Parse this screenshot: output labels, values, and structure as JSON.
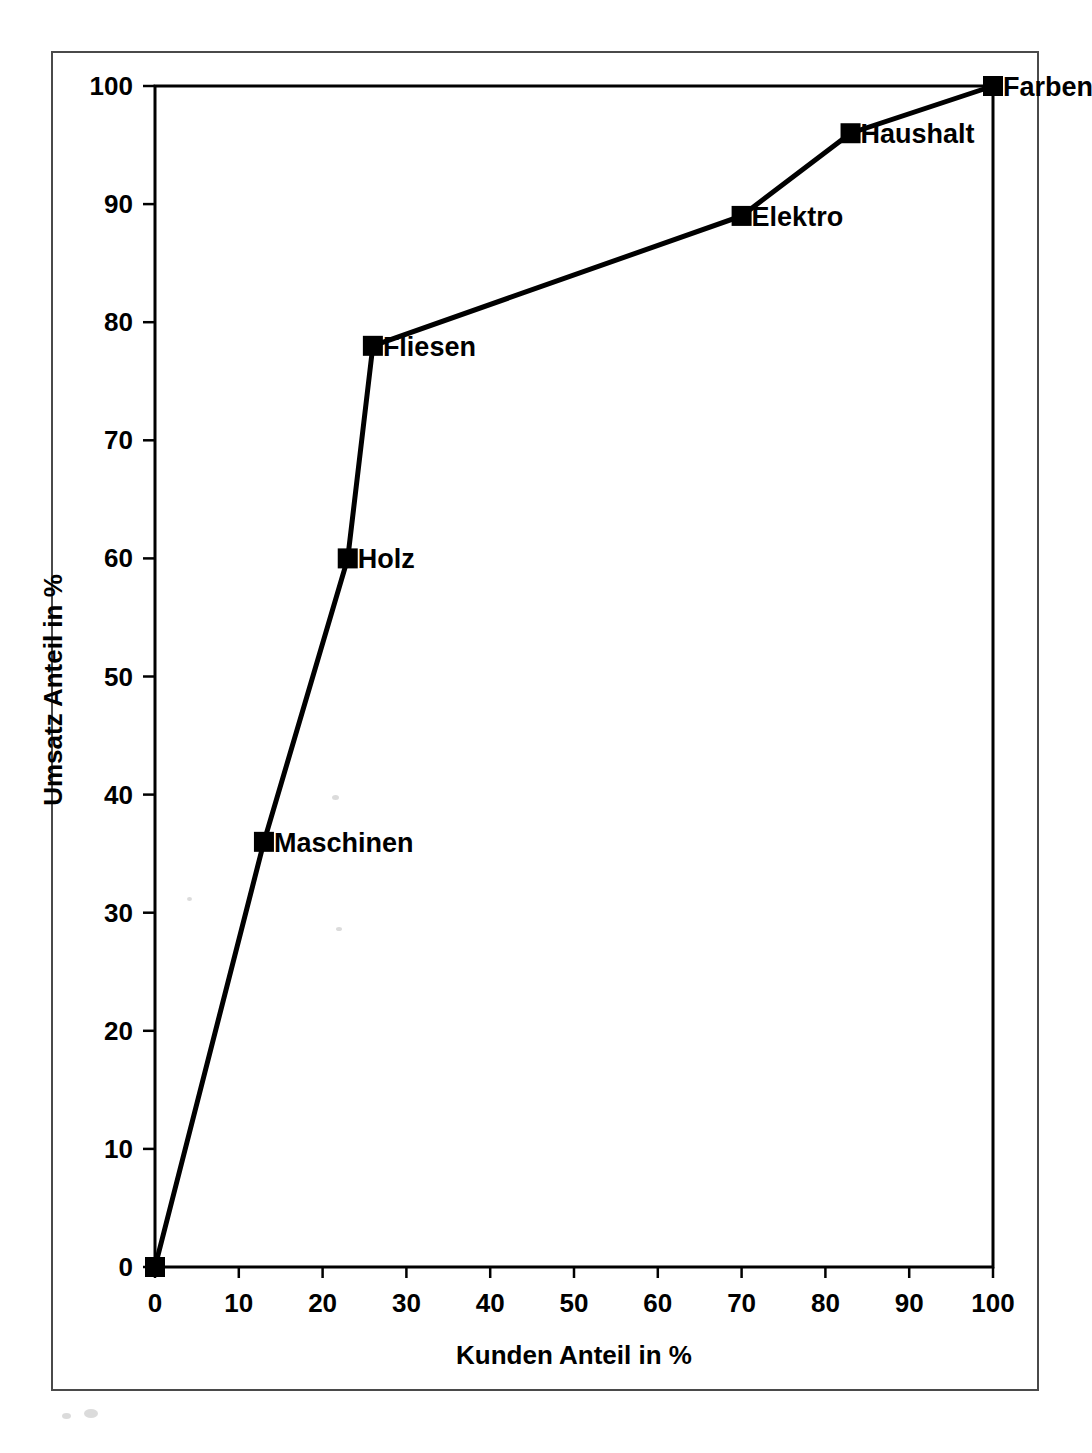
{
  "chart_data": {
    "type": "line",
    "title": "",
    "subtitle": "",
    "xlabel": "Kunden Anteil in %",
    "ylabel": "Umsatz Anteil in %",
    "xlim": [
      0,
      100
    ],
    "ylim": [
      0,
      100
    ],
    "xticks": [
      0,
      10,
      20,
      30,
      40,
      50,
      60,
      70,
      80,
      90,
      100
    ],
    "yticks": [
      0,
      10,
      20,
      30,
      40,
      50,
      60,
      70,
      80,
      90,
      100
    ],
    "xtick_labels": [
      "0",
      "10",
      "20",
      "30",
      "40",
      "50",
      "60",
      "70",
      "80",
      "90",
      "100"
    ],
    "ytick_labels": [
      "0",
      "10",
      "20",
      "30",
      "40",
      "50",
      "60",
      "70",
      "80",
      "90",
      "100"
    ],
    "grid": false,
    "legend": false,
    "marker": "filled-square",
    "line_color": "#000000",
    "marker_color": "#000000",
    "series": [
      {
        "name": "Kumulierte Umsatzkurve",
        "x": [
          0,
          13,
          23,
          26,
          70,
          83,
          100
        ],
        "y": [
          0,
          36,
          60,
          78,
          89,
          96,
          100
        ],
        "point_labels": [
          "",
          "Maschinen",
          "Holz",
          "Fliesen",
          "Elektro",
          "Haushalt",
          "Farben"
        ]
      }
    ],
    "annotations": [
      {
        "text": "Maschinen",
        "x": 13,
        "y": 36
      },
      {
        "text": "Holz",
        "x": 23,
        "y": 60
      },
      {
        "text": "Fliesen",
        "x": 26,
        "y": 78
      },
      {
        "text": "Elektro",
        "x": 70,
        "y": 89
      },
      {
        "text": "Haushalt",
        "x": 83,
        "y": 96
      },
      {
        "text": "Farben",
        "x": 100,
        "y": 100
      }
    ]
  },
  "figure": {
    "axis_line_color": "#000000",
    "page_border_color": "#4a4a4a",
    "background": "#ffffff"
  }
}
